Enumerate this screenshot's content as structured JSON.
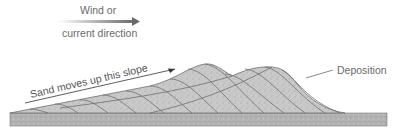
{
  "labels": {
    "wind_line1": "Wind or",
    "wind_line2": "current direction",
    "slope": "Sand moves up this slope",
    "deposition": "Deposition"
  },
  "colors": {
    "sand_fill": "#c8c8c8",
    "base_fill": "#b5b5b5",
    "layer_lines": "#6e6e6e",
    "arrow": "#6a6a6a",
    "text": "#6a6a6a"
  }
}
